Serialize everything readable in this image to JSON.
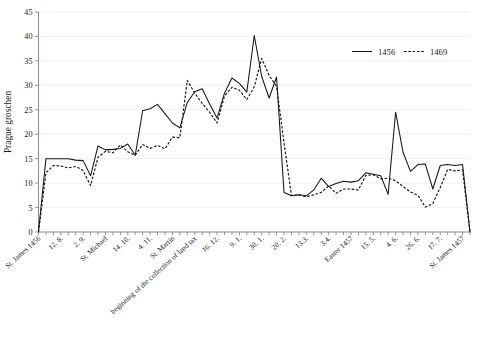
{
  "chart_data": {
    "type": "line",
    "title": "",
    "xlabel": "",
    "ylabel": "Prague groschen",
    "ylim": [
      0,
      45
    ],
    "ytick_step": 5,
    "yticks": [
      0,
      5,
      10,
      15,
      20,
      25,
      30,
      35,
      40,
      45
    ],
    "grid": true,
    "legend_position": "top-right",
    "legend": [
      "1456",
      "1469"
    ],
    "xlabels": [
      "St. James 1456",
      "12. 8.",
      "2. 9.",
      "St. Michael",
      "14. 10.",
      "4. 11.",
      "St. Martin",
      "beginning of the collection of land tax",
      "16. 12.",
      "9. 1.",
      "30. 1.",
      "20. 2.",
      "13.3.",
      "3.4.",
      "Easter 1457",
      "15. 5.",
      "4. 6.",
      "26. 6.",
      "17. 7.",
      "St. James 1457"
    ],
    "xlabel_indices": [
      0,
      3,
      6,
      9,
      12,
      15,
      18,
      21,
      24,
      27,
      30,
      33,
      36,
      39,
      42,
      45,
      48,
      51,
      54,
      57
    ],
    "n_points": 59,
    "series": [
      {
        "name": "1456",
        "dash": false,
        "values": [
          0,
          15,
          15,
          15,
          15,
          14.7,
          14.6,
          11.5,
          17.6,
          16.8,
          16.9,
          17.1,
          18,
          15.7,
          24.8,
          25.2,
          26.1,
          24.2,
          22.3,
          21.3,
          26.5,
          28.7,
          29.3,
          26.2,
          23.3,
          28.4,
          31.5,
          30.4,
          28.6,
          40.2,
          31.8,
          27.4,
          31.7,
          8.1,
          7.4,
          7.6,
          7.4,
          8.6,
          11,
          9.3,
          9.9,
          10.4,
          10.2,
          10.5,
          12.1,
          11.8,
          11.5,
          7.7,
          24.5,
          16.3,
          12.4,
          13.8,
          13.9,
          8.8,
          13.6,
          13.8,
          13.6,
          13.8,
          0
        ]
      },
      {
        "name": "1469",
        "dash": true,
        "values": [
          0,
          12.1,
          13.6,
          13.5,
          13.1,
          13.4,
          12.6,
          9.5,
          15.3,
          16.5,
          16.2,
          17.8,
          16.4,
          15.7,
          17.9,
          17.1,
          17.7,
          17,
          19.4,
          19.3,
          31,
          28.4,
          26.3,
          24.5,
          22.3,
          27.8,
          29.6,
          29,
          27.1,
          29.7,
          35.5,
          32,
          29.8,
          18.2,
          7.5,
          7.6,
          7.2,
          7.6,
          8.1,
          9.4,
          7.9,
          8.8,
          8.8,
          8.6,
          11.6,
          11.7,
          10.9,
          11,
          10.5,
          9.3,
          8.2,
          7.5,
          5.1,
          5.8,
          9.1,
          12.8,
          12.5,
          12.7,
          0
        ]
      }
    ]
  }
}
